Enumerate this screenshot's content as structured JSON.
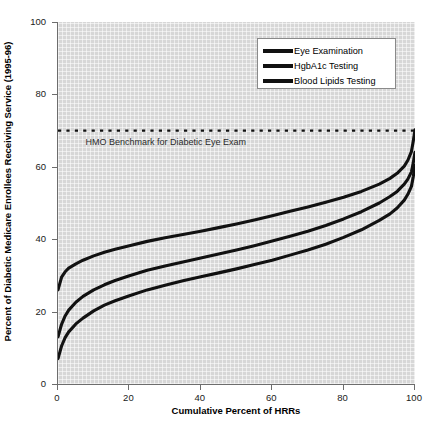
{
  "chart_data": {
    "type": "line",
    "title": "",
    "xlabel": "Cumulative Percent of HRRs",
    "ylabel": "Percent of Diabetic Medicare Enrollees Receiving Service (1995-96)",
    "xlim": [
      0,
      100
    ],
    "ylim": [
      0,
      100
    ],
    "xticks": [
      0,
      20,
      40,
      60,
      80,
      100
    ],
    "yticks": [
      0,
      20,
      40,
      60,
      80,
      100
    ],
    "grid": true,
    "legend_position": "top-right",
    "annotations": [
      {
        "name": "hmo-benchmark",
        "text": "HMO Benchmark for Diabetic Eye Exam",
        "value": 70,
        "style": "dotted-horizontal-line"
      }
    ],
    "series": [
      {
        "name": "Eye Examination",
        "color": "#111111",
        "x": [
          0,
          1,
          2,
          3,
          5,
          7,
          10,
          13,
          16,
          20,
          25,
          30,
          35,
          40,
          45,
          50,
          55,
          60,
          65,
          70,
          75,
          80,
          85,
          90,
          93,
          95,
          97,
          98,
          99,
          99.5,
          100
        ],
        "y": [
          26.0,
          29.5,
          31.0,
          32.0,
          33.2,
          34.2,
          35.4,
          36.4,
          37.2,
          38.2,
          39.4,
          40.4,
          41.3,
          42.2,
          43.2,
          44.2,
          45.3,
          46.5,
          47.7,
          48.9,
          50.2,
          51.6,
          53.2,
          55.2,
          56.8,
          58.2,
          60.2,
          61.8,
          64.2,
          67.0,
          70.2
        ]
      },
      {
        "name": "HgbA1c Testing",
        "color": "#111111",
        "x": [
          0,
          1,
          2,
          3,
          5,
          7,
          10,
          13,
          16,
          20,
          25,
          30,
          35,
          40,
          45,
          50,
          55,
          60,
          65,
          70,
          75,
          80,
          85,
          90,
          93,
          95,
          97,
          98,
          99,
          99.5,
          100
        ],
        "y": [
          13.0,
          16.5,
          18.8,
          20.4,
          22.6,
          24.2,
          26.0,
          27.4,
          28.6,
          29.9,
          31.4,
          32.6,
          33.7,
          34.8,
          35.9,
          37.0,
          38.2,
          39.5,
          40.8,
          42.2,
          43.8,
          45.6,
          47.6,
          50.0,
          51.8,
          53.2,
          55.2,
          56.6,
          58.6,
          61.0,
          64.0
        ]
      },
      {
        "name": "Blood Lipids Testing",
        "color": "#111111",
        "x": [
          0,
          1,
          2,
          3,
          5,
          7,
          10,
          13,
          16,
          20,
          25,
          30,
          35,
          40,
          45,
          50,
          55,
          60,
          65,
          70,
          75,
          80,
          85,
          90,
          93,
          95,
          97,
          98,
          99,
          99.5,
          100
        ],
        "y": [
          7.0,
          10.5,
          12.8,
          14.4,
          16.6,
          18.2,
          20.2,
          21.8,
          23.0,
          24.4,
          26.0,
          27.3,
          28.5,
          29.6,
          30.7,
          31.8,
          33.0,
          34.2,
          35.6,
          37.0,
          38.6,
          40.5,
          42.6,
          45.2,
          47.0,
          48.6,
          50.8,
          52.4,
          54.6,
          57.2,
          60.4
        ]
      }
    ]
  },
  "legend": {
    "items": [
      {
        "label": "Eye Examination"
      },
      {
        "label": "HgbA1c Testing"
      },
      {
        "label": "Blood Lipids Testing"
      }
    ]
  },
  "axes": {
    "y_title": "Percent of Diabetic Medicare Enrollees Receiving Service (1995-96)",
    "x_title": "Cumulative Percent of HRRs",
    "y_tick_labels": [
      "0",
      "20",
      "40",
      "60",
      "80",
      "100"
    ],
    "x_tick_labels": [
      "0",
      "20",
      "40",
      "60",
      "80",
      "100"
    ]
  },
  "benchmark": {
    "label": "HMO Benchmark for Diabetic Eye Exam"
  },
  "colors": {
    "plot_background": "#d7d7d7",
    "line": "#111111",
    "axis": "#6d6d6d",
    "text": "#000000"
  }
}
